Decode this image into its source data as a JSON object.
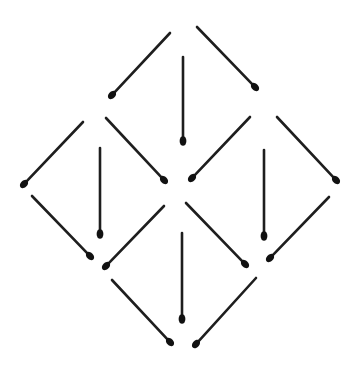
{
  "diagram": {
    "colors": {
      "background": "#ffffff",
      "stick": "#1e1e1e",
      "head": "#111111"
    },
    "matchsticks": [
      {
        "id": "top-upper-left",
        "group": "top",
        "x1": 170,
        "y1": 33,
        "x2": 112,
        "y2": 95
      },
      {
        "id": "top-upper-right",
        "group": "top",
        "x1": 197,
        "y1": 27,
        "x2": 255,
        "y2": 87
      },
      {
        "id": "top-center",
        "group": "top",
        "x1": 183,
        "y1": 57,
        "x2": 183,
        "y2": 141
      },
      {
        "id": "top-lower-left",
        "group": "top",
        "x1": 106,
        "y1": 118,
        "x2": 164,
        "y2": 180
      },
      {
        "id": "top-lower-right",
        "group": "top",
        "x1": 250,
        "y1": 117,
        "x2": 192,
        "y2": 178
      },
      {
        "id": "left-upper-left",
        "group": "left",
        "x1": 83,
        "y1": 122,
        "x2": 24,
        "y2": 184
      },
      {
        "id": "left-center",
        "group": "left",
        "x1": 100,
        "y1": 148,
        "x2": 100,
        "y2": 234
      },
      {
        "id": "left-lower-left",
        "group": "left",
        "x1": 32,
        "y1": 196,
        "x2": 90,
        "y2": 256
      },
      {
        "id": "left-lower-right",
        "group": "left",
        "x1": 164,
        "y1": 206,
        "x2": 106,
        "y2": 266
      },
      {
        "id": "right-upper-right",
        "group": "right",
        "x1": 277,
        "y1": 117,
        "x2": 336,
        "y2": 180
      },
      {
        "id": "right-center",
        "group": "right",
        "x1": 264,
        "y1": 150,
        "x2": 264,
        "y2": 236
      },
      {
        "id": "right-lower-right",
        "group": "right",
        "x1": 329,
        "y1": 197,
        "x2": 270,
        "y2": 258
      },
      {
        "id": "right-lower-left",
        "group": "right",
        "x1": 186,
        "y1": 203,
        "x2": 245,
        "y2": 264
      },
      {
        "id": "bottom-center",
        "group": "bottom",
        "x1": 182,
        "y1": 233,
        "x2": 182,
        "y2": 319
      },
      {
        "id": "bottom-lower-left",
        "group": "bottom",
        "x1": 112,
        "y1": 280,
        "x2": 170,
        "y2": 342
      },
      {
        "id": "bottom-lower-right",
        "group": "bottom",
        "x1": 256,
        "y1": 278,
        "x2": 196,
        "y2": 344
      }
    ]
  }
}
